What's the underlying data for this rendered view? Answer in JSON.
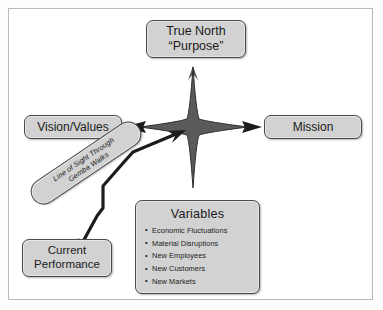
{
  "diagram": {
    "title_box": {
      "line1": "True North",
      "line2": "“Purpose”"
    },
    "left_box": {
      "label": "Vision/Values"
    },
    "right_box": {
      "label": "Mission"
    },
    "bottom_left_box": {
      "line1": "Current",
      "line2": "Performance"
    },
    "variables_box": {
      "title": "Variables",
      "items": [
        "Economic Fluctuations",
        "Material Disruptions",
        "New Employees",
        "New Customers",
        "New Markets"
      ]
    },
    "line_of_sight": {
      "line1": "Line of Sight Through",
      "line2": "Gemba Walks"
    },
    "center": {
      "shape": "four-pointed-compass-star"
    },
    "colors": {
      "star_fill": "#5a5a5a",
      "box_fill": "#d2d2d2",
      "box_border": "#4a4a4a",
      "connector": "#1c1c1c",
      "frame_border": "#b9b9b9",
      "page_background": "#ffffff"
    }
  }
}
